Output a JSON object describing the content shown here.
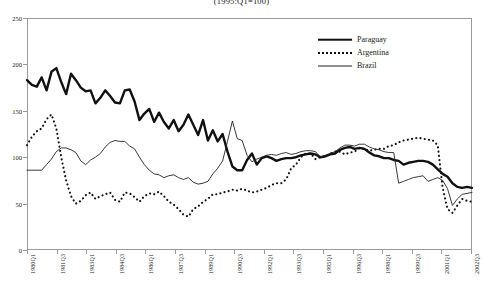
{
  "chart_data": {
    "type": "line",
    "title": "(1995:Q1=100)",
    "xlabel": "",
    "ylabel": "",
    "ylim": [
      0,
      250
    ],
    "yticks": [
      0,
      50,
      100,
      150,
      200,
      250
    ],
    "grid": false,
    "legend_position": "top-right",
    "x_start": "1980Q1",
    "x_end": "2002Q4",
    "tick_labels": [
      "1980Q1",
      "1981Q3",
      "1983Q1",
      "1984Q3",
      "1986Q1",
      "1987Q3",
      "1989Q1",
      "1990Q3",
      "1992Q1",
      "1993Q3",
      "1995Q1",
      "1996Q3",
      "1998Q1",
      "1999Q3",
      "2001Q1",
      "2002Q3"
    ],
    "x": [
      "1980Q1",
      "1980Q2",
      "1980Q3",
      "1980Q4",
      "1981Q1",
      "1981Q2",
      "1981Q3",
      "1981Q4",
      "1982Q1",
      "1982Q2",
      "1982Q3",
      "1982Q4",
      "1983Q1",
      "1983Q2",
      "1983Q3",
      "1983Q4",
      "1984Q1",
      "1984Q2",
      "1984Q3",
      "1984Q4",
      "1985Q1",
      "1985Q2",
      "1985Q3",
      "1985Q4",
      "1986Q1",
      "1986Q2",
      "1986Q3",
      "1986Q4",
      "1987Q1",
      "1987Q2",
      "1987Q3",
      "1987Q4",
      "1988Q1",
      "1988Q2",
      "1988Q3",
      "1988Q4",
      "1989Q1",
      "1989Q2",
      "1989Q3",
      "1989Q4",
      "1990Q1",
      "1990Q2",
      "1990Q3",
      "1990Q4",
      "1991Q1",
      "1991Q2",
      "1991Q3",
      "1991Q4",
      "1992Q1",
      "1992Q2",
      "1992Q3",
      "1992Q4",
      "1993Q1",
      "1993Q2",
      "1993Q3",
      "1993Q4",
      "1994Q1",
      "1994Q2",
      "1994Q3",
      "1994Q4",
      "1995Q1",
      "1995Q2",
      "1995Q3",
      "1995Q4",
      "1996Q1",
      "1996Q2",
      "1996Q3",
      "1996Q4",
      "1997Q1",
      "1997Q2",
      "1997Q3",
      "1997Q4",
      "1998Q1",
      "1998Q2",
      "1998Q3",
      "1998Q4",
      "1999Q1",
      "1999Q2",
      "1999Q3",
      "1999Q4",
      "2000Q1",
      "2000Q2",
      "2000Q3",
      "2000Q4",
      "2001Q1",
      "2001Q2",
      "2001Q3",
      "2001Q4",
      "2002Q1",
      "2002Q2",
      "2002Q3",
      "2002Q4"
    ],
    "series": [
      {
        "name": "Paraguay",
        "style": "thick-solid",
        "color": "#111111",
        "values": [
          183,
          178,
          176,
          186,
          172,
          192,
          196,
          181,
          168,
          190,
          183,
          175,
          171,
          172,
          158,
          164,
          172,
          166,
          159,
          158,
          172,
          173,
          160,
          140,
          147,
          152,
          138,
          148,
          138,
          131,
          140,
          128,
          135,
          146,
          135,
          124,
          140,
          118,
          129,
          117,
          125,
          106,
          90,
          86,
          86,
          97,
          104,
          92,
          99,
          101,
          99,
          96,
          98,
          99,
          99,
          100,
          102,
          103,
          104,
          103,
          100,
          101,
          103,
          104,
          108,
          110,
          111,
          109,
          110,
          109,
          105,
          102,
          101,
          99,
          99,
          97,
          96,
          92,
          94,
          95,
          96,
          96,
          95,
          92,
          87,
          82,
          79,
          72,
          68,
          67,
          68,
          67
        ]
      },
      {
        "name": "Argentina",
        "style": "dotted",
        "color": "#111111",
        "values": [
          113,
          122,
          128,
          131,
          141,
          146,
          131,
          100,
          75,
          58,
          50,
          53,
          59,
          62,
          55,
          58,
          60,
          62,
          54,
          52,
          62,
          61,
          57,
          52,
          58,
          61,
          60,
          63,
          58,
          52,
          49,
          44,
          38,
          36,
          44,
          47,
          52,
          55,
          60,
          60,
          62,
          63,
          65,
          64,
          66,
          64,
          62,
          63,
          65,
          67,
          70,
          72,
          72,
          76,
          88,
          92,
          100,
          104,
          104,
          98,
          100,
          101,
          104,
          106,
          106,
          103,
          105,
          106,
          110,
          109,
          107,
          108,
          109,
          109,
          112,
          113,
          116,
          118,
          119,
          120,
          121,
          120,
          119,
          118,
          113,
          67,
          44,
          40,
          48,
          55,
          53,
          52
        ]
      },
      {
        "name": "Brazil",
        "style": "thin-solid",
        "color": "#222222",
        "values": [
          86,
          86,
          86,
          86,
          92,
          98,
          106,
          110,
          110,
          108,
          105,
          96,
          92,
          97,
          100,
          104,
          111,
          116,
          118,
          117,
          117,
          112,
          109,
          100,
          92,
          86,
          82,
          81,
          78,
          80,
          81,
          78,
          76,
          78,
          73,
          71,
          72,
          74,
          82,
          88,
          96,
          117,
          139,
          120,
          118,
          102,
          95,
          98,
          100,
          102,
          103,
          102,
          104,
          105,
          103,
          104,
          106,
          107,
          107,
          106,
          100,
          102,
          104,
          106,
          110,
          113,
          113,
          112,
          114,
          114,
          111,
          109,
          108,
          106,
          105,
          105,
          72,
          74,
          76,
          78,
          79,
          80,
          74,
          76,
          78,
          75,
          66,
          48,
          55,
          60,
          61,
          62
        ]
      }
    ]
  },
  "legend": {
    "items": [
      {
        "label": "Paraguay"
      },
      {
        "label": "Argentina"
      },
      {
        "label": "Brazil"
      }
    ]
  }
}
